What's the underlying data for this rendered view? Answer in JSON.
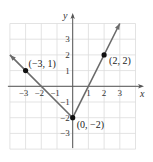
{
  "chart_data": {
    "type": "line",
    "title": "",
    "xlabel": "x",
    "ylabel": "y",
    "xlim": [
      -4,
      4
    ],
    "ylim": [
      -4,
      4
    ],
    "grid": true,
    "x_ticks": [
      {
        "value": -3,
        "label": "−3"
      },
      {
        "value": -2,
        "label": "−2"
      },
      {
        "value": -1,
        "label": "−1"
      },
      {
        "value": 1,
        "label": "1"
      },
      {
        "value": 2,
        "label": "2"
      },
      {
        "value": 3,
        "label": "3"
      }
    ],
    "y_ticks": [
      {
        "value": 3,
        "label": "3"
      },
      {
        "value": 2,
        "label": "2"
      },
      {
        "value": 1,
        "label": "1"
      },
      {
        "value": -1,
        "label": "−1"
      },
      {
        "value": -2,
        "label": "−2"
      },
      {
        "value": -3,
        "label": "−3"
      }
    ],
    "series": [
      {
        "name": "piecewise-graph",
        "x": [
          -4,
          0,
          3
        ],
        "y": [
          2,
          -2,
          4
        ],
        "arrows_at_ends": true
      }
    ],
    "points": [
      {
        "x": -3,
        "y": 1,
        "label": "(−3, 1)"
      },
      {
        "x": 2,
        "y": 2,
        "label": "(2, 2)"
      },
      {
        "x": 0,
        "y": -2,
        "label": "(0, −2)"
      }
    ],
    "colors": {
      "line": "#6b6b6b",
      "points": "#111111",
      "grid": "#dcdcdc",
      "axes": "#555555"
    }
  }
}
